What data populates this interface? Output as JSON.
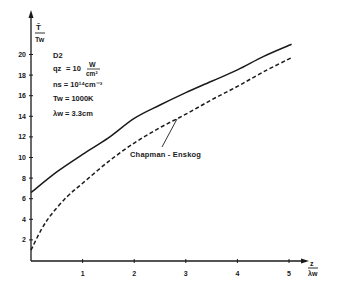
{
  "chart_data": {
    "type": "line",
    "title": "",
    "xlabel": "z / λw",
    "ylabel": "T̄ / Tw",
    "xlim": [
      0,
      5.3
    ],
    "ylim": [
      0,
      22.5
    ],
    "xticks": [
      1,
      2,
      3,
      4,
      5
    ],
    "yticks": [
      2,
      4,
      6,
      8,
      10,
      12,
      14,
      16,
      18,
      20
    ],
    "grid": false,
    "legend": "none",
    "series": [
      {
        "name": "calculated",
        "style": "solid",
        "x": [
          0,
          0.5,
          1,
          1.5,
          2,
          2.5,
          3,
          3.5,
          4,
          4.5,
          5.05
        ],
        "values": [
          6.6,
          8.6,
          10.3,
          11.9,
          13.8,
          15.1,
          16.3,
          17.4,
          18.5,
          19.8,
          21.0
        ]
      },
      {
        "name": "Chapman - Enskog",
        "style": "dashed",
        "x": [
          0,
          0.2,
          0.4,
          0.7,
          1,
          1.5,
          2,
          2.5,
          3,
          3.5,
          4,
          4.5,
          5.05
        ],
        "values": [
          1.0,
          3.0,
          4.5,
          6.2,
          7.5,
          9.6,
          11.4,
          12.9,
          14.2,
          15.6,
          16.9,
          18.3,
          19.7
        ]
      }
    ],
    "annotations": [
      {
        "text": "Chapman - Enskog",
        "points_to": "dashed series near z≈2.9"
      }
    ],
    "parameters": [
      "D2",
      "qz = 10 W/cm²",
      "ns = 10¹⁴ cm⁻³",
      "Tw = 1000K",
      "λw = 3.3cm"
    ]
  },
  "labels": {
    "y_axis_top": "T̄",
    "y_axis_bottom": "Tw",
    "x_axis_top": "z",
    "x_axis_bottom": "λw",
    "annotation": "Chapman - Enskog"
  },
  "params": {
    "gas": "D2",
    "qz_name": "qz",
    "qz_eq": "= 10",
    "qz_unit_num": "W",
    "qz_unit_den": "cm²",
    "ns": "ns = 10¹⁴cm⁻³",
    "tw": "Tw = 1000K",
    "lw": "λw = 3.3cm"
  },
  "ticks": {
    "x": [
      "1",
      "2",
      "3",
      "4",
      "5"
    ],
    "y": [
      "2",
      "4",
      "6",
      "8",
      "10",
      "12",
      "14",
      "16",
      "18",
      "20"
    ]
  },
  "colors": {
    "ink": "#1a1a1a",
    "background": "#ffffff"
  }
}
